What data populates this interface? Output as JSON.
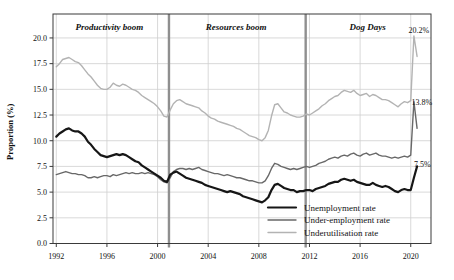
{
  "figure": {
    "y_axis_title": "Proportion (%)",
    "period_labels": [
      {
        "text": "Productivity boom",
        "x_year": 1996.2,
        "y_value": 21.1
      },
      {
        "text": "Resources boom",
        "x_year": 2006.2,
        "y_value": 21.1
      },
      {
        "text": "Dog Days",
        "x_year": 2016.6,
        "y_value": 21.1
      }
    ],
    "period_divider_years": [
      2000.9,
      2011.7
    ],
    "annotations": [
      {
        "text": "20.2%",
        "x_year": 2019.82,
        "y_value": 20.8
      },
      {
        "text": "13.8%",
        "x_year": 2020.05,
        "y_value": 13.7
      },
      {
        "text": "7.5%",
        "x_year": 2020.25,
        "y_value": 7.75
      }
    ],
    "colors": {
      "unemployment": "#161616",
      "under_employment": "#686868",
      "underutilisation": "#b3b3b3",
      "gridline": "#cfcfcf",
      "frame": "#3a3a3a",
      "divider": "#8f8f8f",
      "text": "#111111",
      "background": "#ffffff"
    }
  },
  "chart_data": {
    "type": "line",
    "title": "",
    "xlabel": "",
    "ylabel": "Proportion (%)",
    "grid": true,
    "legend_position": "lower right inside, no frame",
    "xlim": [
      1991.74,
      2021.6
    ],
    "ylim": [
      0,
      22.33
    ],
    "x_tick_values": [
      1992,
      1996,
      2000,
      2004,
      2008,
      2012,
      2016,
      2020
    ],
    "x_tick_labels": [
      "1992",
      "1996",
      "2000",
      "2004",
      "2008",
      "2012",
      "2016",
      "2020"
    ],
    "y_tick_values": [
      0,
      2.5,
      5,
      7.5,
      10,
      12.5,
      15,
      17.5,
      20
    ],
    "y_tick_labels": [
      "0.0",
      "2.5",
      "5.0",
      "7.5",
      "10.0",
      "12.5",
      "15.0",
      "17.5",
      "20.0"
    ],
    "x_start": 1992.0,
    "x_step_years": 0.25,
    "x_end": 2020.5,
    "series": [
      {
        "name": "Unemployment rate",
        "color": "#161616",
        "width": 2.2,
        "values": [
          10.4,
          10.7,
          10.9,
          11.1,
          11.2,
          11.0,
          10.9,
          10.9,
          10.7,
          10.4,
          9.9,
          9.6,
          9.2,
          8.9,
          8.6,
          8.5,
          8.4,
          8.5,
          8.6,
          8.7,
          8.6,
          8.7,
          8.6,
          8.4,
          8.2,
          8.0,
          7.9,
          7.6,
          7.4,
          7.2,
          7.0,
          6.8,
          6.6,
          6.4,
          6.1,
          6.0,
          6.7,
          6.9,
          7.0,
          6.8,
          6.6,
          6.4,
          6.3,
          6.2,
          6.1,
          6.0,
          5.9,
          5.7,
          5.6,
          5.5,
          5.4,
          5.3,
          5.2,
          5.1,
          5.0,
          5.1,
          5.0,
          4.9,
          4.8,
          4.6,
          4.5,
          4.4,
          4.3,
          4.2,
          4.1,
          4.0,
          4.2,
          4.5,
          5.2,
          5.7,
          5.8,
          5.6,
          5.4,
          5.3,
          5.2,
          5.2,
          5.0,
          5.1,
          5.1,
          5.2,
          5.2,
          5.1,
          5.3,
          5.4,
          5.5,
          5.6,
          5.8,
          5.9,
          6.0,
          6.0,
          6.2,
          6.3,
          6.2,
          6.1,
          6.2,
          6.0,
          5.9,
          5.8,
          5.7,
          5.7,
          5.9,
          5.7,
          5.6,
          5.5,
          5.6,
          5.5,
          5.3,
          5.1,
          5.0,
          5.2,
          5.3,
          5.2,
          5.2,
          6.4,
          7.5
        ]
      },
      {
        "name": "Under-employment rate",
        "color": "#686868",
        "width": 1.4,
        "values": [
          6.7,
          6.8,
          6.9,
          7.0,
          6.9,
          6.8,
          6.8,
          6.7,
          6.7,
          6.6,
          6.4,
          6.4,
          6.5,
          6.4,
          6.5,
          6.6,
          6.6,
          6.5,
          6.7,
          6.6,
          6.7,
          6.8,
          6.9,
          6.8,
          6.9,
          6.8,
          6.8,
          6.9,
          6.8,
          6.9,
          6.8,
          6.7,
          6.5,
          6.2,
          6.0,
          5.9,
          6.4,
          7.0,
          7.2,
          7.3,
          7.3,
          7.2,
          7.3,
          7.2,
          7.3,
          7.4,
          7.2,
          7.1,
          7.0,
          6.9,
          6.8,
          6.8,
          6.7,
          6.6,
          6.7,
          6.6,
          6.5,
          6.4,
          6.4,
          6.3,
          6.2,
          6.1,
          6.1,
          6.0,
          5.9,
          5.9,
          6.1,
          6.6,
          7.3,
          7.8,
          7.7,
          7.5,
          7.4,
          7.3,
          7.2,
          7.3,
          7.2,
          7.3,
          7.4,
          7.5,
          7.4,
          7.5,
          7.6,
          7.8,
          7.9,
          8.0,
          8.2,
          8.3,
          8.4,
          8.3,
          8.5,
          8.6,
          8.5,
          8.7,
          8.8,
          8.6,
          8.5,
          8.7,
          8.8,
          8.6,
          8.7,
          8.8,
          8.6,
          8.5,
          8.5,
          8.4,
          8.3,
          8.4,
          8.3,
          8.4,
          8.5,
          8.4,
          8.6,
          13.8,
          11.2
        ]
      },
      {
        "name": "Underutilisation rate",
        "color": "#b3b3b3",
        "width": 1.4,
        "values": [
          17.2,
          17.5,
          17.9,
          18.0,
          18.1,
          17.9,
          17.7,
          17.6,
          17.3,
          16.9,
          16.5,
          16.2,
          15.8,
          15.4,
          15.1,
          15.0,
          15.0,
          15.2,
          15.6,
          15.4,
          15.3,
          15.5,
          15.4,
          15.2,
          15.0,
          14.9,
          14.7,
          14.4,
          14.2,
          14.0,
          13.8,
          13.6,
          13.3,
          12.9,
          12.4,
          12.3,
          13.0,
          13.6,
          13.9,
          14.0,
          13.8,
          13.6,
          13.5,
          13.4,
          13.3,
          13.2,
          12.9,
          12.7,
          12.4,
          12.2,
          12.1,
          11.9,
          11.8,
          11.7,
          11.6,
          11.5,
          11.4,
          11.2,
          11.1,
          10.9,
          10.7,
          10.5,
          10.4,
          10.3,
          10.1,
          10.0,
          10.3,
          11.0,
          12.4,
          13.5,
          13.6,
          13.2,
          12.8,
          12.7,
          12.5,
          12.4,
          12.3,
          12.3,
          12.4,
          12.6,
          12.5,
          12.7,
          12.9,
          13.1,
          13.4,
          13.6,
          13.9,
          14.1,
          14.3,
          14.4,
          14.7,
          14.9,
          14.8,
          14.7,
          14.9,
          14.6,
          14.4,
          14.5,
          14.6,
          14.3,
          14.5,
          14.4,
          14.2,
          14.0,
          14.0,
          13.9,
          13.7,
          13.5,
          13.3,
          13.6,
          13.8,
          13.7,
          13.9,
          20.2,
          18.2
        ]
      }
    ]
  }
}
